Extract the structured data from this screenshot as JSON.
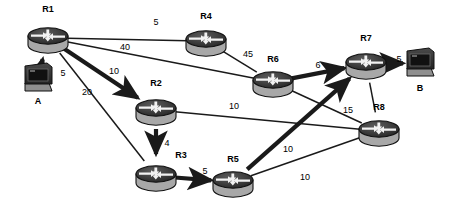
{
  "diagram": {
    "type": "network-graph",
    "background": "#ffffff",
    "line_color": "#1a1a1a",
    "router_body_color": "#9a9a9a",
    "router_top_color": "#3c3c3c",
    "host_color": "#2b2b2b"
  },
  "nodes": [
    {
      "id": "R1",
      "label": "R1",
      "kind": "router",
      "x": 48,
      "y": 38,
      "label_x": 48,
      "label_y": 12
    },
    {
      "id": "R2",
      "label": "R2",
      "kind": "router",
      "x": 156,
      "y": 110,
      "label_x": 156,
      "label_y": 86
    },
    {
      "id": "R3",
      "label": "R3",
      "kind": "router",
      "x": 156,
      "y": 176,
      "label_x": 181,
      "label_y": 158
    },
    {
      "id": "R4",
      "label": "R4",
      "kind": "router",
      "x": 206,
      "y": 41,
      "label_x": 206,
      "label_y": 19
    },
    {
      "id": "R5",
      "label": "R5",
      "kind": "router",
      "x": 233,
      "y": 182,
      "label_x": 233,
      "label_y": 162
    },
    {
      "id": "R6",
      "label": "R6",
      "kind": "router",
      "x": 273,
      "y": 82,
      "label_x": 273,
      "label_y": 62
    },
    {
      "id": "R7",
      "label": "R7",
      "kind": "router",
      "x": 366,
      "y": 64,
      "label_x": 366,
      "label_y": 41
    },
    {
      "id": "R8",
      "label": "R8",
      "kind": "router",
      "x": 379,
      "y": 131,
      "label_x": 379,
      "label_y": 110
    }
  ],
  "hosts": [
    {
      "id": "A",
      "label": "A",
      "kind": "workstation",
      "x": 38,
      "y": 78,
      "label_x": 38,
      "label_y": 104
    },
    {
      "id": "B",
      "label": "B",
      "kind": "workstation",
      "x": 420,
      "y": 63,
      "label_x": 420,
      "label_y": 91
    }
  ],
  "edges": [
    {
      "from": "A",
      "to": "R1",
      "cost": "5",
      "style": "thick",
      "arrow": true,
      "label_x": 63,
      "label_y": 76
    },
    {
      "from": "R1",
      "to": "R4",
      "cost": "5",
      "style": "thin",
      "arrow": false,
      "label_x": 156,
      "label_y": 25
    },
    {
      "from": "R1",
      "to": "R6",
      "cost": "40",
      "style": "thin",
      "arrow": false,
      "label_x": 125,
      "label_y": 50
    },
    {
      "from": "R1",
      "to": "R2",
      "cost": "10",
      "style": "thick",
      "arrow": true,
      "label_x": 114,
      "label_y": 74
    },
    {
      "from": "R1",
      "to": "R3",
      "cost": "20",
      "style": "thin",
      "arrow": false,
      "label_x": 87,
      "label_y": 95
    },
    {
      "from": "R4",
      "to": "R6",
      "cost": "45",
      "style": "thin",
      "arrow": false,
      "label_x": 248,
      "label_y": 57
    },
    {
      "from": "R6",
      "to": "R7",
      "cost": "6",
      "style": "thick",
      "arrow": true,
      "label_x": 318,
      "label_y": 68
    },
    {
      "from": "R7",
      "to": "B",
      "cost": "5",
      "style": "thick",
      "arrow": true,
      "label_x": 399,
      "label_y": 62
    },
    {
      "from": "R2",
      "to": "R3",
      "cost": "4",
      "style": "thick",
      "arrow": true,
      "label_x": 167,
      "label_y": 146
    },
    {
      "from": "R2",
      "to": "R8",
      "cost": "10",
      "style": "thin",
      "arrow": false,
      "label_x": 234,
      "label_y": 109
    },
    {
      "from": "R3",
      "to": "R5",
      "cost": "5",
      "style": "thick",
      "arrow": true,
      "label_x": 205,
      "label_y": 174
    },
    {
      "from": "R5",
      "to": "R7",
      "cost": "10",
      "style": "thick",
      "arrow": true,
      "label_x": 288,
      "label_y": 152
    },
    {
      "from": "R5",
      "to": "R8",
      "cost": "10",
      "style": "thin",
      "arrow": false,
      "label_x": 305,
      "label_y": 180
    },
    {
      "from": "R6",
      "to": "R8",
      "cost": "",
      "style": "thin",
      "arrow": false,
      "label_x": 0,
      "label_y": 0
    },
    {
      "from": "R8",
      "to": "R7",
      "cost": "15",
      "style": "thin",
      "arrow": false,
      "label_x": 348,
      "label_y": 113
    }
  ]
}
